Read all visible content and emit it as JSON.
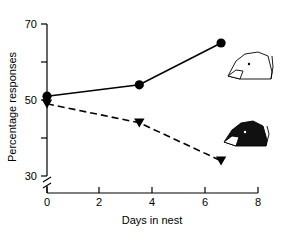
{
  "chart_data": {
    "type": "line",
    "title": "",
    "subtitle": "",
    "xlabel": "Days in nest",
    "ylabel": "Percentage responses",
    "xlim": [
      0,
      8
    ],
    "ylim": [
      30,
      70
    ],
    "xticks": [
      0,
      2,
      4,
      6,
      8
    ],
    "xtick_labels": [
      "0",
      "2",
      "4",
      "6",
      "8"
    ],
    "yticks": [
      30,
      40,
      50,
      60,
      70
    ],
    "ytick_labels": [
      "30",
      "",
      "50",
      "",
      "70"
    ],
    "grid": false,
    "legend": "none",
    "axis_break": {
      "axis": "y",
      "below": 30,
      "symbol": "double-slash"
    },
    "series": [
      {
        "name": "white-head",
        "marker": "filled-circle",
        "linestyle": "solid",
        "color": "#000000",
        "x": [
          0,
          3.5,
          6.6
        ],
        "values": [
          51,
          54,
          65
        ]
      },
      {
        "name": "black-head",
        "marker": "filled-triangle-down",
        "linestyle": "dashed",
        "color": "#000000",
        "x": [
          0,
          3.5,
          6.6
        ],
        "values": [
          49,
          44,
          34
        ]
      }
    ],
    "annotations": [
      {
        "name": "white-head-icon",
        "label": "outline bird head",
        "filled": false,
        "near_series": "white-head"
      },
      {
        "name": "black-head-icon",
        "label": "filled bird head",
        "filled": true,
        "near_series": "black-head"
      }
    ]
  },
  "axes": {
    "y_title": "Percentage responses",
    "x_title": "Days in nest",
    "y_labels": {
      "top": "70",
      "middle": "50",
      "bottom": "30"
    },
    "x_labels": {
      "t0": "0",
      "t1": "2",
      "t2": "4",
      "t3": "6",
      "t4": "8"
    }
  }
}
